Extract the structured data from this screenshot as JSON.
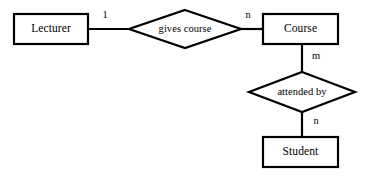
{
  "diagram": {
    "type": "er-diagram",
    "notation": "chen",
    "canvas": {
      "width": 365,
      "height": 178
    },
    "colors": {
      "background": "#ffffff",
      "stroke": "#000000",
      "text": "#000000",
      "fill": "#ffffff"
    },
    "entities": [
      {
        "id": "lecturer",
        "label": "Lecturer",
        "shape": "rectangle",
        "x": 14,
        "y": 14,
        "width": 74,
        "height": 30,
        "center_x": 51,
        "center_y": 29
      },
      {
        "id": "course",
        "label": "Course",
        "shape": "rectangle",
        "x": 263,
        "y": 14,
        "width": 75,
        "height": 30,
        "center_x": 300.5,
        "center_y": 29
      },
      {
        "id": "student",
        "label": "Student",
        "shape": "rectangle",
        "x": 263,
        "y": 137,
        "width": 75,
        "height": 30,
        "center_x": 300.5,
        "center_y": 152
      }
    ],
    "relationships": [
      {
        "id": "gives-course",
        "label": "gives course",
        "shape": "diamond",
        "center_x": 185,
        "center_y": 29,
        "half_width": 56,
        "half_height": 19,
        "connects": [
          "lecturer",
          "course"
        ]
      },
      {
        "id": "attended-by",
        "label": "attended by",
        "shape": "diamond",
        "center_x": 302,
        "center_y": 92,
        "half_width": 53,
        "half_height": 20,
        "connects": [
          "course",
          "student"
        ]
      }
    ],
    "connectors": [
      {
        "id": "lecturer-to-gives-course",
        "from": "lecturer",
        "to": "gives-course",
        "x1": 88,
        "y1": 29,
        "x2": 129,
        "y2": 29,
        "cardinality": "1",
        "label_x": 105,
        "label_y": 15
      },
      {
        "id": "gives-course-to-course",
        "from": "gives-course",
        "to": "course",
        "x1": 241,
        "y1": 29,
        "x2": 263,
        "y2": 29,
        "cardinality": "n",
        "label_x": 248,
        "label_y": 15
      },
      {
        "id": "course-to-attended-by",
        "from": "course",
        "to": "attended-by",
        "x1": 302,
        "y1": 44,
        "x2": 302,
        "y2": 72,
        "cardinality": "m",
        "label_x": 316,
        "label_y": 56
      },
      {
        "id": "attended-by-to-student",
        "from": "attended-by",
        "to": "student",
        "x1": 302,
        "y1": 112,
        "x2": 302,
        "y2": 137,
        "cardinality": "n",
        "label_x": 316,
        "label_y": 121
      }
    ],
    "cardinality_labels": [
      {
        "id": "card-lecturer",
        "text": "1"
      },
      {
        "id": "card-course-top",
        "text": "n"
      },
      {
        "id": "card-course-bottom",
        "text": "m"
      },
      {
        "id": "card-student",
        "text": "n"
      }
    ]
  }
}
